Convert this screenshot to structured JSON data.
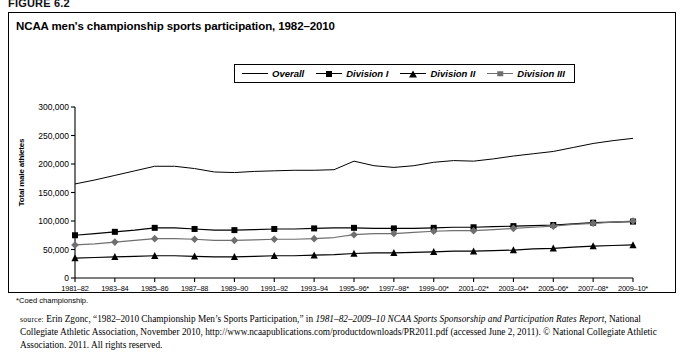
{
  "figure": {
    "label": "FIGURE 6.2",
    "title": "NCAA men's championship sports participation, 1982–2010"
  },
  "footnote": "*Coed championship.",
  "source": {
    "caps": "source:",
    "part1": " Erin Zgonc, “1982–2010 Championship Men’s Sports Participation,” in ",
    "italic1": "1981–82–2009–10 NCAA Sports Sponsorship and Participation Rates Report",
    "part2": ", National Collegiate Athletic Association, November 2010, http://www.ncaapublications.com/productdownloads/PR2011.pdf (accessed June 2, 2011). © National Collegiate Athletic Association. 2011. All rights reserved."
  },
  "chart_data": {
    "type": "line",
    "title": "NCAA men's championship sports participation, 1982–2010",
    "xlabel": "",
    "ylabel": "Total male athletes",
    "ylim": [
      0,
      300000
    ],
    "yticks": [
      0,
      50000,
      100000,
      150000,
      200000,
      250000,
      300000
    ],
    "ytick_labels": [
      "0",
      "50,000",
      "100,000",
      "150,000",
      "200,000",
      "250,000",
      "300,000"
    ],
    "grid": false,
    "legend_position": "top-center",
    "x": [
      "1981–82",
      "1982–83",
      "1983–84",
      "1984–85",
      "1985–86",
      "1986–87",
      "1987–88",
      "1988–89",
      "1989–90",
      "1990–91",
      "1991–92",
      "1992–93",
      "1993–94",
      "1994–95",
      "1995–96*",
      "1996–97*",
      "1997–98*",
      "1998–99*",
      "1999–00*",
      "2000–01*",
      "2001–02*",
      "2002–03*",
      "2003–04*",
      "2004–05*",
      "2005–06*",
      "2006–07*",
      "2007–08*",
      "2008–09*",
      "2009–10*"
    ],
    "xtick_labels": [
      "1981–82",
      "1983–84",
      "1985–86",
      "1987–88",
      "1989–90",
      "1991–92",
      "1993–94",
      "1995–96*",
      "1997–98*",
      "1999–00*",
      "2001–02*",
      "2003–04*",
      "2005–06*",
      "2007–08*",
      "2009–10*"
    ],
    "xtick_indices": [
      0,
      2,
      4,
      6,
      8,
      10,
      12,
      14,
      16,
      18,
      20,
      22,
      24,
      26,
      28
    ],
    "series": [
      {
        "name": "Overall",
        "marker": "none",
        "color": "#000000",
        "values": [
          165000,
          172000,
          180000,
          188000,
          196000,
          196000,
          192000,
          186000,
          185000,
          187000,
          188000,
          189000,
          189000,
          190000,
          205000,
          197000,
          194000,
          197000,
          203000,
          206000,
          205000,
          209000,
          214000,
          218000,
          222000,
          229000,
          236000,
          241000,
          245000
        ]
      },
      {
        "name": "Division I",
        "marker": "square",
        "color": "#000000",
        "values": [
          75000,
          78000,
          81000,
          84000,
          88000,
          88000,
          86000,
          84000,
          84000,
          85000,
          86000,
          86000,
          87000,
          88000,
          88000,
          87000,
          87000,
          87000,
          88000,
          89000,
          89000,
          90000,
          91000,
          92000,
          93000,
          95000,
          97000,
          98000,
          99000
        ]
      },
      {
        "name": "Division II",
        "marker": "triangle",
        "color": "#000000",
        "values": [
          35000,
          36000,
          37000,
          38000,
          39000,
          39000,
          38000,
          37000,
          37000,
          38000,
          39000,
          39000,
          40000,
          41000,
          43000,
          44000,
          44000,
          45000,
          46000,
          47000,
          47000,
          48000,
          49000,
          51000,
          52000,
          54000,
          56000,
          57000,
          58000
        ]
      },
      {
        "name": "Division III",
        "marker": "diamond",
        "color": "#6f6f6f",
        "values": [
          58000,
          60000,
          63000,
          66000,
          69000,
          69000,
          68000,
          66000,
          66000,
          67000,
          68000,
          68000,
          69000,
          71000,
          76000,
          78000,
          78000,
          80000,
          82000,
          83000,
          83000,
          85000,
          87000,
          89000,
          91000,
          94000,
          96000,
          98000,
          100000
        ]
      }
    ]
  }
}
